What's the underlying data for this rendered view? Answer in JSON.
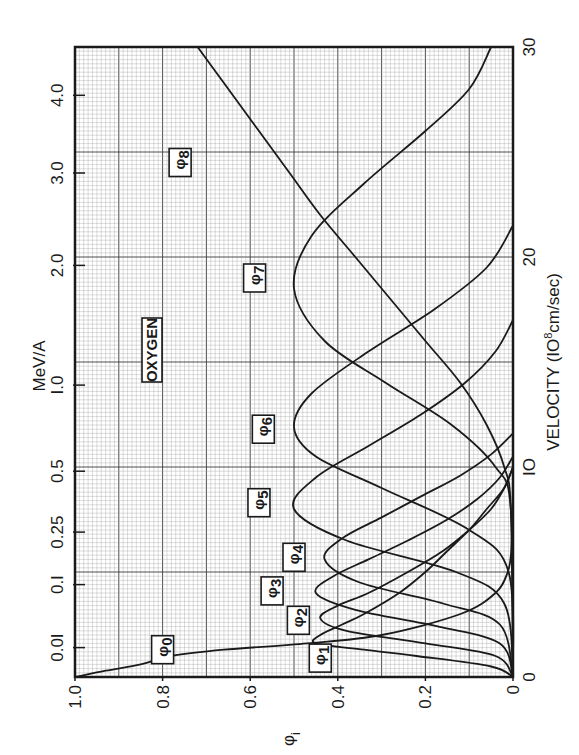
{
  "chart_data": {
    "type": "line",
    "orientation": "rotated-90-ccw",
    "title": "",
    "annotation": "OXYGEN",
    "xlabel": "VELOCITY (10^8 cm/sec)",
    "xlabel_parts": {
      "main": "VELOCITY  (IO",
      "sup": "8",
      "tail": "cm/sec)"
    },
    "ylabel": "φi",
    "ylabel_parts": {
      "main": "φ",
      "sub": "i"
    },
    "secondary_xlabel": "MeV/A",
    "xlim": [
      0,
      30
    ],
    "ylim": [
      0,
      1.0
    ],
    "grid": true,
    "x_ticks": [
      {
        "value": 0,
        "label": "0"
      },
      {
        "value": 10,
        "label": "IO"
      },
      {
        "value": 20,
        "label": "20"
      },
      {
        "value": 30,
        "label": "30"
      }
    ],
    "y_ticks": [
      {
        "value": 1.0,
        "label": "1.0"
      },
      {
        "value": 0.8,
        "label": "0.8"
      },
      {
        "value": 0.6,
        "label": "0.6"
      },
      {
        "value": 0.4,
        "label": "0.4"
      },
      {
        "value": 0.2,
        "label": "0.2"
      },
      {
        "value": 0.0,
        "label": "0"
      }
    ],
    "energy_ticks": [
      {
        "velocity": 1.4,
        "label": "0.0I"
      },
      {
        "velocity": 4.4,
        "label": "0.I"
      },
      {
        "velocity": 6.9,
        "label": "0.25"
      },
      {
        "velocity": 9.8,
        "label": "0.5"
      },
      {
        "velocity": 13.9,
        "label": "I.0"
      },
      {
        "velocity": 19.6,
        "label": "2.0"
      },
      {
        "velocity": 24.0,
        "label": "3.0"
      },
      {
        "velocity": 27.7,
        "label": "4.0"
      }
    ],
    "series": [
      {
        "name": "φ0",
        "label_main": "φ",
        "label_sub": "0",
        "label_velocity": 1.3,
        "label_phi": 0.8,
        "x": [
          0,
          0.3,
          0.6,
          1.0,
          1.3,
          1.6,
          2.0,
          3.0,
          4.0,
          5.0,
          6.0,
          8.0,
          10.0
        ],
        "values": [
          1.0,
          0.93,
          0.85,
          0.78,
          0.66,
          0.47,
          0.3,
          0.12,
          0.04,
          0.012,
          0.004,
          0.001,
          0.0
        ]
      },
      {
        "name": "φ1",
        "label_main": "φ",
        "label_sub": "1",
        "label_velocity": 0.9,
        "label_phi": 0.44,
        "x": [
          0,
          0.5,
          1.0,
          1.3,
          1.6,
          2.0,
          2.5,
          3.0,
          4.0,
          5.0,
          6.0,
          7.0,
          8.0,
          9.0,
          10.0
        ],
        "values": [
          0.0,
          0.05,
          0.22,
          0.34,
          0.45,
          0.44,
          0.39,
          0.34,
          0.26,
          0.2,
          0.15,
          0.1,
          0.06,
          0.02,
          0.0
        ]
      },
      {
        "name": "φ2",
        "label_main": "φ",
        "label_sub": "2",
        "label_velocity": 2.7,
        "label_phi": 0.49,
        "x": [
          0,
          1.0,
          1.6,
          2.2,
          2.8,
          3.4,
          4.0,
          5.0,
          6.0,
          7.0,
          8.0,
          9.0,
          10.0
        ],
        "values": [
          0.0,
          0.04,
          0.2,
          0.38,
          0.44,
          0.4,
          0.33,
          0.24,
          0.16,
          0.1,
          0.05,
          0.02,
          0.0
        ]
      },
      {
        "name": "φ3",
        "label_main": "φ",
        "label_sub": "3",
        "label_velocity": 4.1,
        "label_phi": 0.55,
        "x": [
          0,
          1.6,
          2.4,
          3.2,
          4.0,
          4.8,
          5.6,
          6.5,
          7.5,
          8.5,
          9.5,
          10.5
        ],
        "values": [
          0.0,
          0.03,
          0.17,
          0.36,
          0.45,
          0.41,
          0.33,
          0.24,
          0.15,
          0.08,
          0.03,
          0.0
        ]
      },
      {
        "name": "φ4",
        "label_main": "φ",
        "label_sub": "4",
        "label_velocity": 5.7,
        "label_phi": 0.5,
        "x": [
          0,
          2.5,
          3.5,
          4.5,
          5.6,
          6.6,
          7.6,
          8.6,
          9.6,
          10.6,
          11.6
        ],
        "values": [
          0.0,
          0.03,
          0.16,
          0.35,
          0.43,
          0.39,
          0.3,
          0.21,
          0.12,
          0.05,
          0.0
        ]
      },
      {
        "name": "φ5",
        "label_main": "φ",
        "label_sub": "5",
        "label_velocity": 8.3,
        "label_phi": 0.58,
        "x": [
          0,
          3.5,
          5.0,
          6.5,
          8.0,
          9.5,
          11.0,
          12.5,
          14.0,
          15.5,
          17.0
        ],
        "values": [
          0.0,
          0.02,
          0.13,
          0.38,
          0.5,
          0.45,
          0.33,
          0.21,
          0.11,
          0.04,
          0.0
        ]
      },
      {
        "name": "φ6",
        "label_main": "φ",
        "label_sub": "6",
        "label_velocity": 11.8,
        "label_phi": 0.57,
        "x": [
          0,
          5.0,
          7.0,
          9.0,
          10.5,
          11.9,
          13.5,
          15.5,
          17.5,
          19.5,
          21.5
        ],
        "values": [
          0.0,
          0.01,
          0.1,
          0.3,
          0.45,
          0.5,
          0.46,
          0.33,
          0.18,
          0.06,
          0.0
        ]
      },
      {
        "name": "φ7",
        "label_main": "φ",
        "label_sub": "7",
        "label_velocity": 19.0,
        "label_phi": 0.59,
        "x": [
          0,
          8.0,
          10.0,
          12.0,
          14.0,
          16.0,
          18.5,
          21.0,
          23.5,
          26.0,
          28.0,
          30.0
        ],
        "values": [
          0.0,
          0.005,
          0.04,
          0.14,
          0.29,
          0.43,
          0.5,
          0.46,
          0.34,
          0.2,
          0.1,
          0.05
        ]
      },
      {
        "name": "φ8",
        "label_main": "φ",
        "label_sub": "8",
        "label_velocity": 24.5,
        "label_phi": 0.76,
        "x": [
          0,
          8.0,
          10.0,
          12.0,
          14.0,
          16.0,
          18.0,
          20.0,
          22.0,
          24.0,
          26.0,
          28.0,
          30.0
        ],
        "values": [
          0.0,
          0.005,
          0.02,
          0.06,
          0.12,
          0.2,
          0.28,
          0.36,
          0.44,
          0.51,
          0.58,
          0.65,
          0.72
        ]
      }
    ]
  },
  "labels": {
    "oxygen": "OXYGEN",
    "mev": "MeV/A"
  },
  "colors": {
    "grid_minor": "#9a9a9a",
    "grid_major": "#3a3a3a",
    "curve": "#1a1a1a",
    "background": "#ffffff"
  }
}
